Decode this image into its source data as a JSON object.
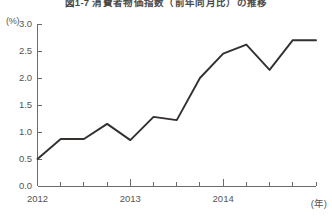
{
  "chart_data": {
    "type": "line",
    "title": "図1-7 消費者物価指数（前年同月比）の推移",
    "xlabel": "(年)",
    "ylabel": "(%)",
    "yunit": "(%)",
    "xunit": "(年)",
    "ylim": [
      0.0,
      3.0
    ],
    "ytick_labels": [
      "0.0",
      "0.5",
      "1.0",
      "1.5",
      "2.0",
      "2.5",
      "3.0"
    ],
    "ytick_values": [
      0.0,
      0.5,
      1.0,
      1.5,
      2.0,
      2.5,
      3.0
    ],
    "xtick_labels": [
      "2012",
      "2013",
      "2014"
    ],
    "xtick_values": [
      0,
      4,
      8
    ],
    "grid": false,
    "legend": false,
    "series_color": "#33302e",
    "categories": [
      "2012Q1",
      "2012Q2",
      "2012Q3",
      "2012Q4",
      "2013Q1",
      "2013Q2",
      "2013Q3",
      "2013Q4",
      "2014Q1",
      "2014Q2",
      "2014Q3",
      "2014Q4",
      "2015Q1"
    ],
    "x": [
      0,
      1,
      2,
      3,
      4,
      5,
      6,
      7,
      8,
      9,
      10,
      11,
      12
    ],
    "values": [
      0.5,
      0.87,
      0.87,
      1.15,
      0.85,
      1.28,
      1.22,
      2.0,
      2.45,
      2.62,
      2.15,
      2.7,
      2.7
    ],
    "series": [
      {
        "name": "消費者物価指数（前年同月比）",
        "values": [
          0.5,
          0.87,
          0.87,
          1.15,
          0.85,
          1.28,
          1.22,
          2.0,
          2.45,
          2.62,
          2.15,
          2.7,
          2.7
        ]
      }
    ]
  }
}
